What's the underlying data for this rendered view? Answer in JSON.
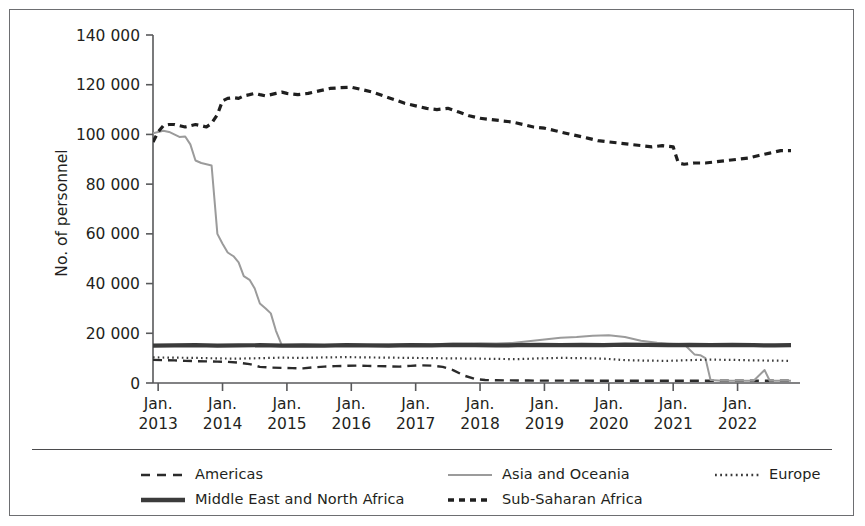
{
  "chart_data": {
    "type": "line",
    "title": "",
    "xlabel": "",
    "ylabel": "No. of personnel",
    "ylim": [
      0,
      140000
    ],
    "ytick_labels": [
      "0",
      "20 000",
      "40 000",
      "60 000",
      "80 000",
      "100 000",
      "120 000",
      "140 000"
    ],
    "ytick_values": [
      0,
      20000,
      40000,
      60000,
      80000,
      100000,
      120000,
      140000
    ],
    "xtick_labels": [
      [
        "Jan.",
        "2013"
      ],
      [
        "Jan.",
        "2014"
      ],
      [
        "Jan.",
        "2015"
      ],
      [
        "Jan.",
        "2016"
      ],
      [
        "Jan.",
        "2017"
      ],
      [
        "Jan.",
        "2018"
      ],
      [
        "Jan.",
        "2019"
      ],
      [
        "Jan.",
        "2020"
      ],
      [
        "Jan.",
        "2021"
      ],
      [
        "Jan.",
        "2022"
      ]
    ],
    "xtick_values": [
      2013.0,
      2014.0,
      2015.0,
      2016.0,
      2017.0,
      2018.0,
      2019.0,
      2020.0,
      2021.0,
      2022.0
    ],
    "xlim": [
      2012.92,
      2022.83
    ],
    "grid": false,
    "legend_position": "bottom",
    "series": [
      {
        "name": "Americas",
        "style": "dashed",
        "color": "#2b2b2b",
        "width": 2.4,
        "dash": "9,6",
        "x": [
          2012.92,
          2013.08,
          2013.25,
          2013.42,
          2013.58,
          2013.75,
          2013.92,
          2014.08,
          2014.25,
          2014.42,
          2014.58,
          2014.75,
          2014.92,
          2015.08,
          2015.25,
          2015.42,
          2015.58,
          2015.75,
          2015.92,
          2016.08,
          2016.25,
          2016.42,
          2016.58,
          2016.75,
          2016.92,
          2017.08,
          2017.25,
          2017.42,
          2017.58,
          2017.75,
          2017.92,
          2018.08,
          2018.25,
          2018.42,
          2018.58,
          2018.75,
          2018.92,
          2019.25,
          2019.58,
          2019.92,
          2020.25,
          2020.58,
          2020.92,
          2021.25,
          2021.58,
          2021.92,
          2022.25,
          2022.58,
          2022.83
        ],
        "y": [
          9300,
          9200,
          9100,
          8900,
          8800,
          8700,
          8600,
          8500,
          8200,
          7600,
          6500,
          6200,
          6100,
          6000,
          5900,
          6300,
          6600,
          6800,
          6900,
          7000,
          6900,
          6800,
          6700,
          6600,
          6900,
          7100,
          7000,
          6500,
          5200,
          3000,
          1600,
          1200,
          1100,
          1050,
          1000,
          980,
          960,
          950,
          940,
          930,
          930,
          920,
          910,
          900,
          900,
          890,
          890,
          880,
          880
        ]
      },
      {
        "name": "Asia and Oceania",
        "style": "solid",
        "color": "#9b9b9b",
        "width": 2.0,
        "dash": "",
        "x": [
          2012.92,
          2013.0,
          2013.08,
          2013.17,
          2013.25,
          2013.33,
          2013.42,
          2013.5,
          2013.58,
          2013.67,
          2013.75,
          2013.83,
          2013.92,
          2014.0,
          2014.08,
          2014.17,
          2014.25,
          2014.33,
          2014.42,
          2014.5,
          2014.58,
          2014.67,
          2014.75,
          2014.83,
          2014.92,
          2015.0,
          2015.25,
          2015.5,
          2015.75,
          2016.0,
          2016.25,
          2016.5,
          2016.75,
          2017.0,
          2017.25,
          2017.5,
          2017.75,
          2018.0,
          2018.25,
          2018.5,
          2018.75,
          2019.0,
          2019.25,
          2019.5,
          2019.75,
          2020.0,
          2020.25,
          2020.5,
          2020.75,
          2021.0,
          2021.17,
          2021.33,
          2021.42,
          2021.5,
          2021.58,
          2021.75,
          2022.0,
          2022.25,
          2022.42,
          2022.5,
          2022.58,
          2022.83
        ],
        "y": [
          100500,
          101000,
          101500,
          101000,
          100000,
          99000,
          99200,
          96000,
          89500,
          88500,
          88000,
          87500,
          60000,
          56000,
          52500,
          51000,
          48500,
          43000,
          41500,
          38000,
          32000,
          30000,
          28000,
          21000,
          15200,
          15000,
          15100,
          15200,
          15300,
          15400,
          15300,
          15500,
          15600,
          15700,
          15600,
          15800,
          15900,
          16000,
          15900,
          16100,
          16800,
          17500,
          18200,
          18500,
          19000,
          19200,
          18500,
          17000,
          16200,
          15800,
          15600,
          11500,
          11200,
          10000,
          1200,
          900,
          900,
          900,
          5200,
          900,
          900,
          900
        ]
      },
      {
        "name": "Europe",
        "style": "dotted",
        "color": "#3a3a3a",
        "width": 2.2,
        "dash": "1.6,3.2",
        "x": [
          2012.92,
          2013.25,
          2013.58,
          2013.92,
          2014.25,
          2014.58,
          2014.92,
          2015.25,
          2015.58,
          2015.92,
          2016.25,
          2016.58,
          2016.92,
          2017.25,
          2017.58,
          2017.92,
          2018.25,
          2018.58,
          2018.92,
          2019.25,
          2019.58,
          2019.92,
          2020.25,
          2020.58,
          2020.92,
          2021.25,
          2021.58,
          2021.92,
          2022.25,
          2022.58,
          2022.83
        ],
        "y": [
          10300,
          10200,
          10100,
          9900,
          9800,
          10000,
          10200,
          10100,
          10300,
          10400,
          10300,
          10200,
          10100,
          10000,
          9900,
          9800,
          9700,
          9600,
          9900,
          10100,
          10000,
          9800,
          9200,
          9000,
          8900,
          9200,
          9400,
          9300,
          9100,
          9000,
          8900
        ]
      },
      {
        "name": "Middle East and North Africa",
        "style": "solid-thick",
        "color": "#3b3b3b",
        "width": 4.2,
        "dash": "",
        "x": [
          2012.92,
          2013.25,
          2013.58,
          2013.92,
          2014.25,
          2014.58,
          2014.92,
          2015.25,
          2015.58,
          2015.92,
          2016.25,
          2016.58,
          2016.92,
          2017.25,
          2017.58,
          2017.92,
          2018.25,
          2018.58,
          2018.92,
          2019.25,
          2019.58,
          2019.92,
          2020.25,
          2020.58,
          2020.92,
          2021.25,
          2021.58,
          2021.92,
          2022.25,
          2022.58,
          2022.83
        ],
        "y": [
          15000,
          15100,
          15200,
          15000,
          15100,
          15200,
          15000,
          15100,
          15000,
          15200,
          15100,
          15000,
          15200,
          15100,
          15300,
          15200,
          15100,
          15200,
          15300,
          15200,
          15300,
          15200,
          15400,
          15300,
          15200,
          15300,
          15200,
          15300,
          15200,
          15100,
          15200
        ]
      },
      {
        "name": "Sub-Saharan Africa",
        "style": "dashed-bold",
        "color": "#1f1f1f",
        "width": 3.2,
        "dash": "7,5",
        "x": [
          2012.92,
          2013.0,
          2013.08,
          2013.17,
          2013.25,
          2013.33,
          2013.42,
          2013.5,
          2013.58,
          2013.67,
          2013.75,
          2013.83,
          2013.92,
          2014.0,
          2014.08,
          2014.17,
          2014.25,
          2014.33,
          2014.42,
          2014.5,
          2014.58,
          2014.67,
          2014.75,
          2014.83,
          2014.92,
          2015.0,
          2015.17,
          2015.33,
          2015.5,
          2015.67,
          2015.83,
          2016.0,
          2016.17,
          2016.33,
          2016.5,
          2016.67,
          2016.83,
          2017.0,
          2017.17,
          2017.33,
          2017.5,
          2017.67,
          2017.83,
          2018.0,
          2018.17,
          2018.33,
          2018.5,
          2018.67,
          2018.83,
          2019.0,
          2019.17,
          2019.33,
          2019.5,
          2019.67,
          2019.83,
          2020.0,
          2020.17,
          2020.33,
          2020.5,
          2020.67,
          2020.83,
          2021.0,
          2021.08,
          2021.17,
          2021.33,
          2021.5,
          2021.67,
          2021.83,
          2022.0,
          2022.17,
          2022.33,
          2022.5,
          2022.67,
          2022.83
        ],
        "y": [
          97000,
          101000,
          103500,
          104000,
          104000,
          103500,
          103000,
          103500,
          104000,
          103500,
          103000,
          104500,
          108000,
          113500,
          114500,
          114800,
          114500,
          115500,
          116000,
          116500,
          116000,
          115500,
          116000,
          116500,
          117000,
          116500,
          116000,
          116500,
          117500,
          118500,
          118800,
          119000,
          118000,
          117000,
          115500,
          114000,
          112500,
          111500,
          110500,
          110000,
          110500,
          109000,
          107500,
          106500,
          106000,
          105500,
          105000,
          104000,
          103000,
          102500,
          101500,
          100500,
          99500,
          98500,
          97500,
          97000,
          96500,
          96000,
          95500,
          95000,
          95500,
          95000,
          88500,
          88000,
          88500,
          88500,
          89000,
          89500,
          90000,
          90500,
          91500,
          92500,
          93500,
          93500
        ]
      }
    ]
  },
  "legend": {
    "columns": [
      {
        "left": 130,
        "items": [
          {
            "label": "Americas",
            "key": "americas-key"
          },
          {
            "label": "Middle East and North Africa",
            "key": "mena-key"
          }
        ]
      },
      {
        "left": 437,
        "items": [
          {
            "label": "Asia and Oceania",
            "key": "asia-oceania-key"
          },
          {
            "label": "Sub-Saharan Africa",
            "key": "sub-saharan-africa-key"
          }
        ]
      },
      {
        "left": 704,
        "items": [
          {
            "label": "Europe",
            "key": "europe-key"
          }
        ]
      }
    ]
  },
  "colors": {
    "frame": "#6d6e71",
    "axis": "#58595b",
    "text": "#231f20",
    "americas": "#2b2b2b",
    "asia_oceania": "#9b9b9b",
    "europe": "#3a3a3a",
    "mena": "#3b3b3b",
    "sub_saharan_africa": "#1f1f1f"
  }
}
